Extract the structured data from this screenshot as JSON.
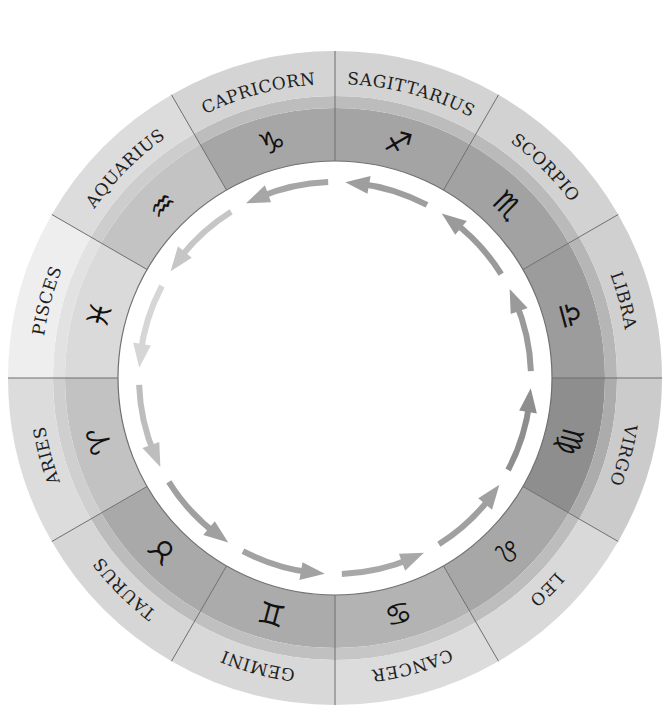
{
  "diagram": {
    "center": {
      "x": 335,
      "y": 378
    },
    "radii": {
      "inner": 217,
      "symbol_band_outer": 270,
      "mid_band_outer": 282,
      "outer": 327,
      "label": 300,
      "symbol": 244,
      "arrow": 196
    },
    "direction": "counterclockwise",
    "segments": [
      {
        "name": "SAGITTARIUS",
        "symbol": "♐",
        "start_deg": 90,
        "end_deg": 60,
        "colors": {
          "inner": "#a4a4a4",
          "mid": "#bcbcbc",
          "outer": "#d3d3d3"
        },
        "arrow_color": "#9e9e9e"
      },
      {
        "name": "SCORPIO",
        "symbol": "♏",
        "start_deg": 60,
        "end_deg": 30,
        "colors": {
          "inner": "#a2a2a2",
          "mid": "#bababa",
          "outer": "#d2d2d2"
        },
        "arrow_color": "#9a9a9a"
      },
      {
        "name": "LIBRA",
        "symbol": "♎",
        "start_deg": 30,
        "end_deg": 0,
        "colors": {
          "inner": "#9c9c9c",
          "mid": "#b6b6b6",
          "outer": "#d0d0d0"
        },
        "arrow_color": "#9a9a9a"
      },
      {
        "name": "VIRGO",
        "symbol": "♍",
        "start_deg": 0,
        "end_deg": -30,
        "colors": {
          "inner": "#8e8e8e",
          "mid": "#acacac",
          "outer": "#cbcbcb"
        },
        "arrow_color": "#8e8e8e"
      },
      {
        "name": "LEO",
        "symbol": "♌",
        "start_deg": -30,
        "end_deg": -60,
        "colors": {
          "inner": "#a7a7a7",
          "mid": "#bdbdbd",
          "outer": "#d9d9d9"
        },
        "arrow_color": "#a0a0a0"
      },
      {
        "name": "CANCER",
        "symbol": "♋",
        "start_deg": -60,
        "end_deg": -90,
        "colors": {
          "inner": "#b3b3b3",
          "mid": "#c6c6c6",
          "outer": "#dcdcdc"
        },
        "arrow_color": "#a8a8a8"
      },
      {
        "name": "GEMINI",
        "symbol": "♊",
        "start_deg": -90,
        "end_deg": -120,
        "colors": {
          "inner": "#ababab",
          "mid": "#c0c0c0",
          "outer": "#d8d8d8"
        },
        "arrow_color": "#a2a2a2"
      },
      {
        "name": "TAURUS",
        "symbol": "♉",
        "start_deg": -120,
        "end_deg": -150,
        "colors": {
          "inner": "#a9a9a9",
          "mid": "#bcbcbc",
          "outer": "#d6d6d6"
        },
        "arrow_color": "#a0a0a0"
      },
      {
        "name": "ARIES",
        "symbol": "♈",
        "start_deg": -150,
        "end_deg": -180,
        "colors": {
          "inner": "#c2c2c2",
          "mid": "#cfcfcf",
          "outer": "#dcdcdc"
        },
        "arrow_color": "#bdbdbd"
      },
      {
        "name": "PISCES",
        "symbol": "♓",
        "start_deg": 180,
        "end_deg": 150,
        "colors": {
          "inner": "#dadada",
          "mid": "#e2e2e2",
          "outer": "#eeeeee"
        },
        "arrow_color": "#d6d6d6"
      },
      {
        "name": "AQUARIUS",
        "symbol": "♒",
        "start_deg": 150,
        "end_deg": 120,
        "colors": {
          "inner": "#c3c3c3",
          "mid": "#cdcdcd",
          "outer": "#dcdcdc"
        },
        "arrow_color": "#c6c6c6"
      },
      {
        "name": "CAPRICORN",
        "symbol": "♑",
        "start_deg": 120,
        "end_deg": 90,
        "colors": {
          "inner": "#a6a6a6",
          "mid": "#bdbdbd",
          "outer": "#d4d4d4"
        },
        "arrow_color": "#a6a6a6"
      }
    ]
  }
}
